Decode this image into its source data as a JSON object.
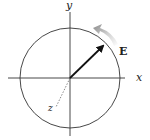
{
  "diagram": {
    "labels": {
      "x_axis": "x",
      "y_axis": "y",
      "z_axis": "z",
      "vector": "E"
    },
    "colors": {
      "lines": "#333333",
      "arrow": "#111111",
      "rotation_arrow": "#9a9a9a",
      "background": "#ffffff"
    },
    "rotation_direction": "counterclockwise"
  }
}
